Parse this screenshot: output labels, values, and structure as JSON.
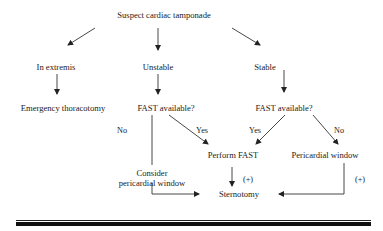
{
  "diagram": {
    "title": "Suspect cardiac tamponade",
    "nodes": {
      "root": "Suspect cardiac tamponade",
      "in_extremis": "In extremis",
      "unstable": "Unstable",
      "stable": "Stable",
      "emergency_thoracotomy": "Emergency thoracotomy",
      "fast_available_unstable": "FAST available?",
      "fast_available_stable": "FAST  available?",
      "consider_line1": "Consider",
      "consider_line2": "pericardial window",
      "perform_fast": "Perform FAST",
      "pericardial_window": "Pericardial window",
      "sternotomy": "Sternotomy"
    },
    "edge_labels": {
      "unstable_no": "No",
      "unstable_yes": "Yes",
      "stable_yes": "Yes",
      "stable_no": "No",
      "perform_fast_positive": "(+)",
      "pericardial_window_positive": "(+)"
    },
    "colors": {
      "line": "#222222",
      "text": "#222222",
      "background": "#ffffff"
    }
  }
}
